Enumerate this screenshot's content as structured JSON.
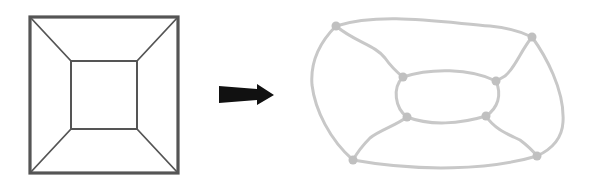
{
  "diagram": {
    "left_figure": {
      "name": "square-graph",
      "stroke": "#555555",
      "outer": [
        [
          30,
          17
        ],
        [
          178,
          17
        ],
        [
          178,
          173
        ],
        [
          30,
          173
        ]
      ],
      "inner": [
        [
          71,
          61
        ],
        [
          137,
          61
        ],
        [
          137,
          129
        ],
        [
          71,
          129
        ]
      ]
    },
    "arrow": {
      "name": "transform-arrow",
      "color": "#111111",
      "from": [
        219,
        94
      ],
      "to": [
        274,
        94
      ]
    },
    "right_figure": {
      "name": "curved-graph",
      "stroke": "#c8c8c8",
      "outer_nodes": [
        [
          336,
          26
        ],
        [
          532,
          37
        ],
        [
          537,
          156
        ],
        [
          353,
          160
        ]
      ],
      "inner_nodes": [
        [
          403,
          77
        ],
        [
          496,
          81
        ],
        [
          486,
          116
        ],
        [
          407,
          117
        ]
      ]
    }
  }
}
